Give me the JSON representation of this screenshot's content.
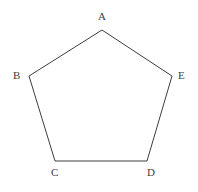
{
  "figure": {
    "name": "pentagon-abcde",
    "type": "polygon",
    "sides": 5,
    "background_color": "#ffffff",
    "stroke_color": "#3d3d3d",
    "stroke_width": 1,
    "fill": "none",
    "canvas": {
      "width": 198,
      "height": 192
    },
    "vertices": [
      {
        "id": "A",
        "label": "A",
        "x": 102,
        "y": 30,
        "label_x": 98,
        "label_y": 11
      },
      {
        "id": "B",
        "label": "B",
        "x": 29,
        "y": 76,
        "label_x": 13,
        "label_y": 70
      },
      {
        "id": "C",
        "label": "C",
        "x": 55,
        "y": 161,
        "label_x": 51,
        "label_y": 167
      },
      {
        "id": "D",
        "label": "D",
        "x": 147,
        "y": 161,
        "label_x": 147,
        "label_y": 167
      },
      {
        "id": "E",
        "label": "E",
        "x": 172,
        "y": 76,
        "label_x": 178,
        "label_y": 70
      }
    ],
    "edges": [
      {
        "from": "A",
        "to": "B"
      },
      {
        "from": "B",
        "to": "C"
      },
      {
        "from": "C",
        "to": "D"
      },
      {
        "from": "D",
        "to": "E"
      },
      {
        "from": "E",
        "to": "A"
      }
    ],
    "label_color": "#3d3d3d",
    "label_font_size": 11
  }
}
